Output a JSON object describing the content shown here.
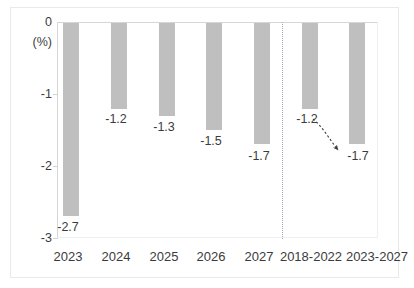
{
  "chart_data": {
    "type": "bar",
    "title": "",
    "subtitle": "",
    "xlabel": "",
    "ylabel": "(%)",
    "unit_label": "(%)",
    "categories": [
      "2023",
      "2024",
      "2025",
      "2026",
      "2027",
      "2018-2022",
      "2023-2027"
    ],
    "values": [
      -2.7,
      -1.2,
      -1.3,
      -1.5,
      -1.7,
      -1.2,
      -1.7
    ],
    "data_labels": [
      "-2.7",
      "-1.2",
      "-1.3",
      "-1.5",
      "-1.7",
      "-1.2",
      "-1.7"
    ],
    "ylim": [
      -3,
      0
    ],
    "yticks": [
      0,
      -1,
      -2,
      -3
    ],
    "ytick_labels": [
      "0",
      "-1",
      "-2",
      "-3"
    ],
    "grid": false,
    "legend": "none",
    "bar_color": "#bfbfbf",
    "text_color": "#3b3b3b",
    "axis_color": "#d6d6d6",
    "separator_color": "#a9a9c4",
    "separator_after_category": "2027",
    "annotation": {
      "type": "arrow",
      "style": "dotted",
      "from_label": "-1.2",
      "to_label": "-1.7",
      "from_category": "2018-2022",
      "to_category": "2023-2027"
    }
  }
}
